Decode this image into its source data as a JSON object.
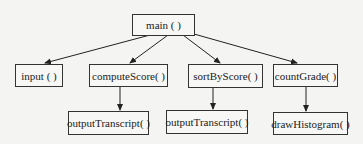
{
  "diagram": {
    "type": "function-call hierarchy",
    "nodes": {
      "main": "main ( )",
      "input": "input ( )",
      "computeScore": "computeScore( )",
      "sortByScore": "sortByScore( )",
      "countGrade": "countGrade( )",
      "outputTranscript1": "outputTranscript( )",
      "outputTranscript2": "outputTranscript( )",
      "drawHistogram": "drawHistogram( )"
    },
    "edges": [
      [
        "main",
        "input"
      ],
      [
        "main",
        "computeScore"
      ],
      [
        "main",
        "sortByScore"
      ],
      [
        "main",
        "countGrade"
      ],
      [
        "computeScore",
        "outputTranscript1"
      ],
      [
        "sortByScore",
        "outputTranscript2"
      ],
      [
        "countGrade",
        "drawHistogram"
      ]
    ]
  }
}
